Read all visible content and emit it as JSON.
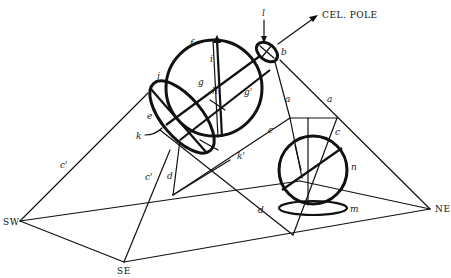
{
  "figure": {
    "title_label": "CEL. POLE",
    "directions": {
      "sw": "SW",
      "se": "SE",
      "ne": "NE"
    },
    "labels": {
      "a1": "a",
      "a2": "a",
      "b": "b",
      "c1": "c",
      "c2": "c",
      "c_prime1": "c'",
      "c_prime2": "c'",
      "d1": "d",
      "d2": "d",
      "e": "e",
      "f": "f",
      "g": "g",
      "g_prime": "g'",
      "h": "h",
      "i": "i",
      "j": "j",
      "k": "k",
      "k_prime": "k'",
      "l": "l",
      "m": "m",
      "n": "n"
    },
    "colors": {
      "ink": "#111111",
      "background": "#ffffff"
    }
  }
}
